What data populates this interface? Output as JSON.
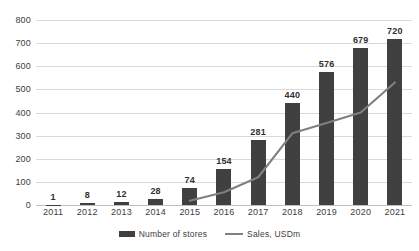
{
  "chart_data": {
    "type": "bar",
    "title": "",
    "subtitle": "",
    "xlabel": "",
    "ylabel": "",
    "categories": [
      "2011",
      "2012",
      "2013",
      "2014",
      "2015",
      "2016",
      "2017",
      "2018",
      "2019",
      "2020",
      "2021"
    ],
    "ylim": [
      0,
      800
    ],
    "yticks": [
      0,
      100,
      200,
      300,
      400,
      500,
      600,
      700,
      800
    ],
    "ytick_labels": [
      "0",
      "100",
      "200",
      "300",
      "400",
      "500",
      "600",
      "700",
      "800"
    ],
    "grid": true,
    "legend_position": "bottom",
    "series": [
      {
        "name": "Number of stores",
        "type": "bar",
        "color": "#404040",
        "values": [
          1,
          8,
          12,
          28,
          74,
          154,
          281,
          440,
          576,
          679,
          720
        ],
        "data_labels": [
          "1",
          "8",
          "12",
          "28",
          "74",
          "154",
          "281",
          "440",
          "576",
          "679",
          "720"
        ]
      },
      {
        "name": "Sales, USDm",
        "type": "line",
        "color": "#808080",
        "values": [
          null,
          null,
          null,
          null,
          18,
          55,
          120,
          310,
          355,
          400,
          530
        ]
      }
    ]
  },
  "legend": {
    "items": [
      {
        "label": "Number of stores",
        "marker": "bar-swatch",
        "color": "#404040"
      },
      {
        "label": "Sales, USDm",
        "marker": "line-swatch",
        "color": "#808080"
      }
    ]
  }
}
